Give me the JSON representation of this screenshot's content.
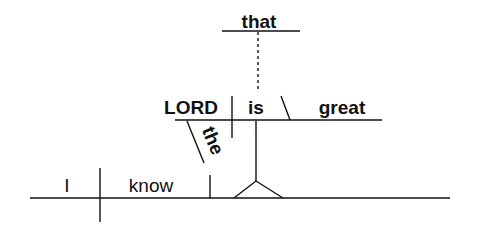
{
  "diagram": {
    "type": "Reed-Kellogg sentence diagram",
    "sentence_words": {
      "subject": "I",
      "verb": "know",
      "clause_subject": "LORD",
      "clause_subject_modifier": "the",
      "clause_verb": "is",
      "clause_complement": "great",
      "conjunction": "that"
    },
    "colors": {
      "line": "#111111",
      "text": "#111111",
      "background": "#ffffff"
    }
  }
}
